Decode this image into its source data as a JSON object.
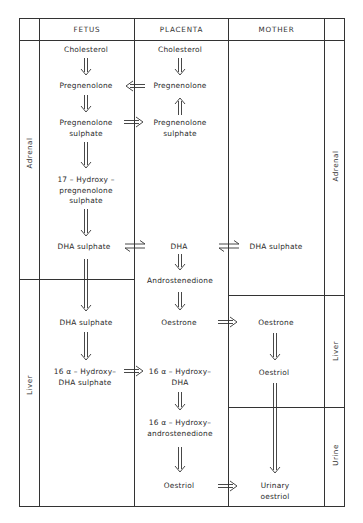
{
  "columns": {
    "fetus": "FETUS",
    "placenta": "PLACENTA",
    "mother": "MOTHER"
  },
  "row_labels": {
    "left_adrenal": "Adrenal",
    "left_liver": "Liver",
    "right_adrenal": "Adrenal",
    "right_liver": "Liver",
    "right_urine": "Urine"
  },
  "fetus": {
    "cholesterol": "Cholesterol",
    "pregnenolone": "Pregnenolone",
    "pregnenolone_sulphate_1": "Pregnenolone",
    "pregnenolone_sulphate_2": "sulphate",
    "hydroxy_preg_1": "17 – Hydroxy –",
    "hydroxy_preg_2": "pregnenolone",
    "hydroxy_preg_3": "sulphate",
    "dha_sulphate_adrenal": "DHA  sulphate",
    "dha_sulphate_liver": "DHA  sulphate",
    "hydroxy_dha_sulphate_1": "16 α – Hydroxy–",
    "hydroxy_dha_sulphate_2": "DHA  sulphate"
  },
  "placenta": {
    "cholesterol": "Cholesterol",
    "pregnenolone": "Pregnenolone",
    "pregnenolone_sulphate_1": "Pregnenolone",
    "pregnenolone_sulphate_2": "sulphate",
    "dha": "DHA",
    "androstenedione": "Androstenedione",
    "oestrone": "Oestrone",
    "hydroxy_dha_1": "16 α – Hydroxy–",
    "hydroxy_dha_2": "DHA",
    "hydroxy_andro_1": "16 α – Hydroxy–",
    "hydroxy_andro_2": "androstenedione",
    "oestriol": "Oestriol"
  },
  "mother": {
    "dha_sulphate": "DHA  sulphate",
    "oestrone": "Oestrone",
    "oestriol": "Oestriol",
    "urinary_oestriol_1": "Urinary",
    "urinary_oestriol_2": "oestriol"
  },
  "colors": {
    "line": "#333333",
    "text": "#2a2a2a",
    "background": "#ffffff"
  }
}
